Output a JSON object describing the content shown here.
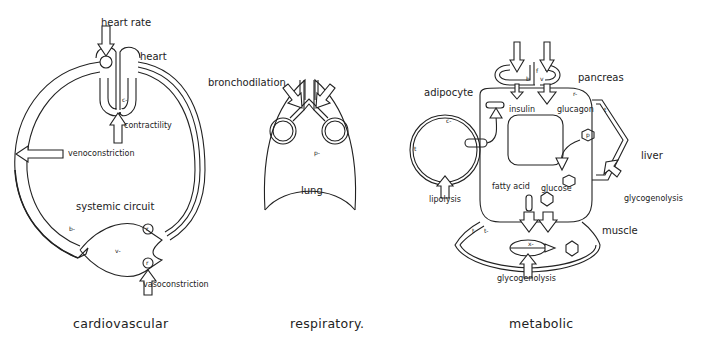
{
  "panels": {
    "cardiovascular": {
      "caption": "cardiovascular",
      "labels": {
        "heart_rate": "heart rate",
        "heart": "heart",
        "contractility": "contractility",
        "venoconstriction": "venoconstriction",
        "systemic_circuit": "systemic circuit",
        "vasoconstriction": "vasoconstriction"
      },
      "symbols": {
        "b": "b-",
        "v": "v-",
        "c": "c-",
        "r_top": "r",
        "r_bottom": "r",
        "s": "s"
      }
    },
    "respiratory": {
      "caption": "respiratory.",
      "labels": {
        "bronchodilation": "bronchodilation",
        "lung": "lung"
      },
      "symbols": {
        "p": "p-"
      }
    },
    "metabolic": {
      "caption": "metabolic",
      "labels": {
        "adipocyte": "adipocyte",
        "pancreas": "pancreas",
        "insulin": "insulin",
        "glucagon": "glucagon",
        "liver": "liver",
        "lipolysis": "lipolysis",
        "fatty_acid": "fatty acid",
        "glucose": "glucose",
        "glycogenolysis_liver": "glycogenolysis",
        "muscle": "muscle",
        "glycogenolysis_muscle": "glycogenolysis"
      },
      "symbols": {
        "c": "c-",
        "b": "b",
        "v": "v",
        "f_pancreas": "f",
        "r": "r-",
        "t_liver": "t",
        "t_adipocyte": "t",
        "t_muscle": "t",
        "t_minus": "t-",
        "p": "p",
        "x": "x-"
      }
    }
  }
}
